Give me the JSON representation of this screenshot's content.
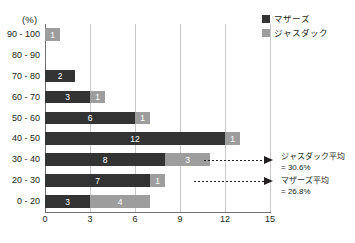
{
  "top_cut_text": "",
  "unit_label": "(%)",
  "legend": {
    "items": [
      {
        "label": "マザーズ",
        "color": "#333333",
        "key": "mothers"
      },
      {
        "label": "ジャスダック",
        "color": "#9d9d9d",
        "key": "jasdaq"
      }
    ]
  },
  "annotations": [
    {
      "line1": "ジャスダック平均",
      "line2": "= 30.6%"
    },
    {
      "line1": "マザーズ平均",
      "line2": "= 26.8%"
    }
  ],
  "chart_data": {
    "type": "bar",
    "orientation": "horizontal",
    "stacked": true,
    "title": "",
    "xlabel": "",
    "ylabel": "(%)",
    "xlim": [
      0,
      15
    ],
    "xticks": [
      0,
      3,
      6,
      9,
      12,
      15
    ],
    "xtick_labels": [
      "0",
      "3",
      "6",
      "9",
      "12",
      "15"
    ],
    "grid": true,
    "legend_position": "top-right",
    "categories": [
      "90 - 100",
      "80 - 90",
      "70 - 80",
      "60 - 70",
      "50 - 60",
      "40 - 50",
      "30 - 40",
      "20 - 30",
      "0 - 20"
    ],
    "series": [
      {
        "name": "マザーズ",
        "color": "#333333",
        "values": [
          0,
          0,
          2,
          3,
          6,
          12,
          8,
          7,
          3
        ]
      },
      {
        "name": "ジャスダック",
        "color": "#9d9d9d",
        "values": [
          1,
          0,
          0,
          1,
          1,
          1,
          3,
          1,
          4
        ]
      }
    ],
    "annotation_values": {
      "jasdaq_mean": "30.6%",
      "mothers_mean": "26.8%"
    }
  }
}
